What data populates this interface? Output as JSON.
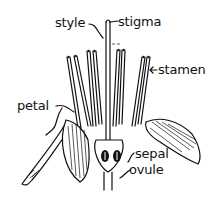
{
  "diagram": {
    "labels": [
      {
        "id": "style",
        "text": "style"
      },
      {
        "id": "stigma",
        "text": "stigma"
      },
      {
        "id": "stamen",
        "text": "stamen"
      },
      {
        "id": "petal",
        "text": "petal"
      },
      {
        "id": "sepal",
        "text": "sepal"
      },
      {
        "id": "ovule",
        "text": "ovule"
      }
    ],
    "colors": {
      "ink": "#111111",
      "background": "#ffffff"
    }
  }
}
